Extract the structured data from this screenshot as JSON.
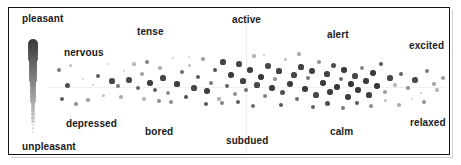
{
  "figure": {
    "frame": {
      "x": 8,
      "y": 7,
      "w": 442,
      "h": 148
    }
  },
  "axis_labels": {
    "top_left": "pleasant",
    "bottom_left": "unpleasant"
  },
  "quadrant_labels": [
    {
      "name": "nervous",
      "text": "nervous",
      "x": 64,
      "y": 47
    },
    {
      "name": "tense",
      "text": "tense",
      "x": 137,
      "y": 26
    },
    {
      "name": "active",
      "text": "active",
      "x": 232,
      "y": 14
    },
    {
      "name": "alert",
      "text": "alert",
      "x": 327,
      "y": 29
    },
    {
      "name": "excited",
      "text": "excited",
      "x": 409,
      "y": 40
    },
    {
      "name": "depressed",
      "text": "depressed",
      "x": 66,
      "y": 118
    },
    {
      "name": "bored",
      "text": "bored",
      "x": 145,
      "y": 126
    },
    {
      "name": "subdued",
      "text": "subdued",
      "x": 226,
      "y": 135
    },
    {
      "name": "calm",
      "text": "calm",
      "x": 330,
      "y": 126
    },
    {
      "name": "relaxed",
      "text": "relaxed",
      "x": 410,
      "y": 117
    }
  ],
  "colors": {
    "frame": "#141414",
    "text": "#1a1a1a",
    "point_dark": "#3a3a3a",
    "point_light": "#c9c9c9",
    "background": "#ffffff"
  },
  "scale_bar": {
    "name": "intensity-gradient-bar",
    "x": 33,
    "y_top": 44,
    "y_bottom": 132,
    "dots": 26,
    "top_radius": 5.2,
    "bottom_radius": 1.1,
    "top_shade": 60,
    "bottom_shade": 225
  },
  "chart_data": {
    "type": "scatter",
    "title": "",
    "xlabel": "",
    "ylabel": "",
    "xlim": [
      0,
      1
    ],
    "ylim": [
      0,
      1
    ],
    "grid": false,
    "legend": "none",
    "annotations": [
      "pleasant",
      "unpleasant",
      "nervous",
      "tense",
      "active",
      "alert",
      "excited",
      "depressed",
      "bored",
      "subdued",
      "calm",
      "relaxed"
    ],
    "note": "Affect circumplex scatter; point shade encodes intensity (dark = high, light = low)",
    "points": [
      [
        68,
        86,
        78
      ],
      [
        76,
        104,
        150
      ],
      [
        83,
        79,
        215
      ],
      [
        93,
        85,
        205
      ],
      [
        98,
        76,
        95
      ],
      [
        104,
        96,
        190
      ],
      [
        112,
        81,
        70
      ],
      [
        118,
        86,
        120
      ],
      [
        124,
        71,
        200
      ],
      [
        129,
        80,
        75
      ],
      [
        134,
        64,
        185
      ],
      [
        138,
        88,
        105
      ],
      [
        142,
        74,
        165
      ],
      [
        147,
        62,
        130
      ],
      [
        150,
        83,
        60
      ],
      [
        155,
        90,
        95
      ],
      [
        160,
        68,
        175
      ],
      [
        163,
        78,
        70
      ],
      [
        168,
        93,
        140
      ],
      [
        173,
        58,
        205
      ],
      [
        177,
        84,
        65
      ],
      [
        182,
        72,
        110
      ],
      [
        186,
        97,
        80
      ],
      [
        190,
        66,
        190
      ],
      [
        194,
        88,
        70
      ],
      [
        198,
        77,
        95
      ],
      [
        203,
        59,
        160
      ],
      [
        207,
        91,
        62
      ],
      [
        211,
        83,
        120
      ],
      [
        215,
        70,
        80
      ],
      [
        219,
        99,
        175
      ],
      [
        223,
        62,
        68
      ],
      [
        227,
        86,
        100
      ],
      [
        231,
        75,
        58
      ],
      [
        235,
        94,
        145
      ],
      [
        239,
        64,
        72
      ],
      [
        243,
        81,
        66
      ],
      [
        246,
        90,
        115
      ],
      [
        250,
        70,
        62
      ],
      [
        254,
        56,
        180
      ],
      [
        257,
        85,
        70
      ],
      [
        261,
        77,
        58
      ],
      [
        265,
        96,
        130
      ],
      [
        268,
        66,
        75
      ],
      [
        272,
        88,
        62
      ],
      [
        275,
        79,
        150
      ],
      [
        279,
        71,
        66
      ],
      [
        283,
        93,
        78
      ],
      [
        286,
        60,
        190
      ],
      [
        290,
        84,
        60
      ],
      [
        294,
        75,
        70
      ],
      [
        297,
        99,
        105
      ],
      [
        301,
        67,
        64
      ],
      [
        305,
        89,
        58
      ],
      [
        308,
        78,
        120
      ],
      [
        312,
        71,
        62
      ],
      [
        316,
        95,
        72
      ],
      [
        319,
        62,
        145
      ],
      [
        323,
        83,
        56
      ],
      [
        327,
        74,
        68
      ],
      [
        330,
        92,
        60
      ],
      [
        334,
        66,
        78
      ],
      [
        337,
        87,
        54
      ],
      [
        341,
        79,
        110
      ],
      [
        344,
        70,
        58
      ],
      [
        348,
        97,
        62
      ],
      [
        351,
        84,
        52
      ],
      [
        355,
        76,
        70
      ],
      [
        358,
        90,
        56
      ],
      [
        362,
        68,
        135
      ],
      [
        366,
        81,
        58
      ],
      [
        369,
        95,
        66
      ],
      [
        373,
        73,
        60
      ],
      [
        377,
        86,
        54
      ],
      [
        381,
        64,
        90
      ],
      [
        385,
        92,
        160
      ],
      [
        390,
        78,
        72
      ],
      [
        395,
        85,
        185
      ],
      [
        401,
        74,
        100
      ],
      [
        408,
        88,
        140
      ],
      [
        415,
        80,
        75
      ],
      [
        421,
        93,
        195
      ],
      [
        427,
        71,
        120
      ],
      [
        434,
        84,
        165
      ],
      [
        59,
        70,
        120
      ],
      [
        62,
        99,
        95
      ],
      [
        71,
        66,
        190
      ],
      [
        88,
        100,
        160
      ],
      [
        108,
        64,
        210
      ],
      [
        121,
        97,
        175
      ],
      [
        144,
        99,
        185
      ],
      [
        159,
        101,
        140
      ],
      [
        171,
        102,
        150
      ],
      [
        189,
        57,
        205
      ],
      [
        206,
        104,
        90
      ],
      [
        222,
        103,
        130
      ],
      [
        238,
        102,
        95
      ],
      [
        253,
        106,
        110
      ],
      [
        264,
        55,
        195
      ],
      [
        281,
        105,
        85
      ],
      [
        299,
        54,
        170
      ],
      [
        313,
        107,
        100
      ],
      [
        328,
        104,
        78
      ],
      [
        343,
        108,
        125
      ],
      [
        357,
        103,
        88
      ],
      [
        371,
        106,
        150
      ],
      [
        386,
        101,
        190
      ],
      [
        399,
        105,
        175
      ],
      [
        412,
        99,
        205
      ],
      [
        424,
        102,
        145
      ],
      [
        437,
        90,
        185
      ],
      [
        443,
        78,
        160
      ]
    ]
  }
}
